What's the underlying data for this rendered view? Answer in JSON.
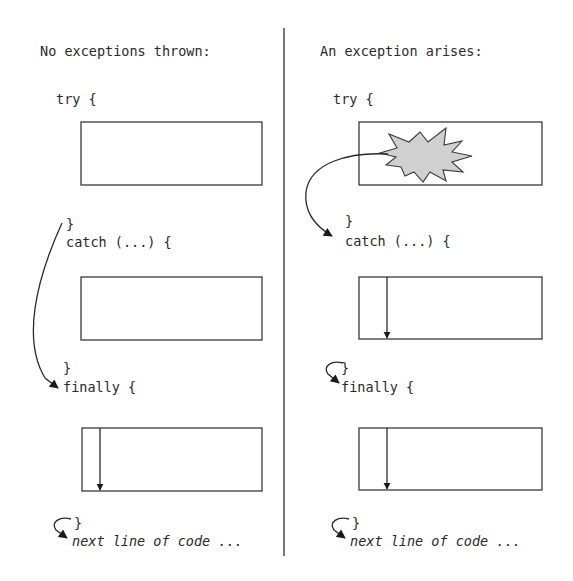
{
  "diagram": {
    "left_panel": {
      "heading": "No exceptions thrown:",
      "try_open": "try {",
      "try_close": "}",
      "catch_open": "catch (...) {",
      "catch_close": "}",
      "finally_open": "finally {",
      "finally_close": "}",
      "next_line": "next line of code ..."
    },
    "right_panel": {
      "heading": "An exception arises:",
      "try_open": "try {",
      "try_close": "}",
      "catch_open": "catch (...) {",
      "catch_close": "}",
      "finally_open": "finally {",
      "finally_close": "}",
      "next_line": "next line of code ..."
    },
    "icons": {
      "exception": "starburst-icon",
      "flow": "arrow-icon"
    },
    "colors": {
      "stroke": "#2a2a2a",
      "starburst_fill": "#d0d0d0",
      "divider": "#555555"
    }
  }
}
